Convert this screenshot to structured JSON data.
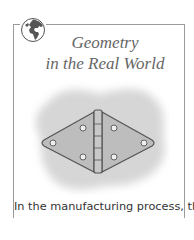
{
  "feature": {
    "icon": "globe-icon",
    "title_line1": "Geometry",
    "title_line2": "in the Real World"
  },
  "figure": {
    "background": "gray-blob"
  },
  "body": {
    "caption": "In the manufacturing process, the"
  },
  "colors": {
    "border": "#9a9a9a",
    "title": "#666666",
    "blob": "#d6d6d6",
    "hinge_fill": "#bdbdbd"
  }
}
